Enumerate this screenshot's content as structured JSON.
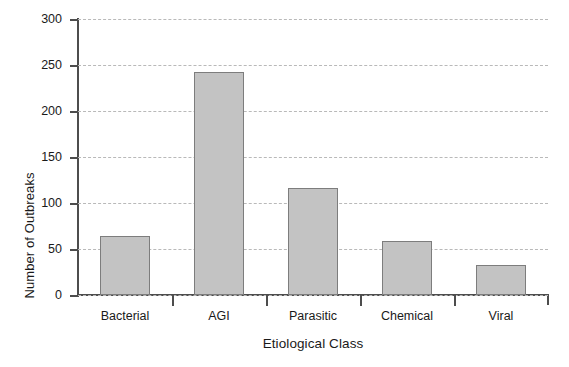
{
  "chart_data": {
    "type": "bar",
    "title": "",
    "xlabel": "Etiological Class",
    "ylabel": "Number of Outbreaks",
    "categories": [
      "Bacterial",
      "AGI",
      "Parasitic",
      "Chemical",
      "Viral"
    ],
    "values": [
      64,
      242,
      116,
      59,
      33
    ],
    "ylim": [
      0,
      300
    ],
    "ytick_values": [
      0,
      50,
      100,
      150,
      200,
      250,
      300
    ],
    "ytick_labels": [
      "0",
      "50",
      "100",
      "150",
      "200",
      "250",
      "300"
    ],
    "grid": "horizontal-dashed",
    "legend": "none",
    "bar_fill_color": "#c3c3c3",
    "bar_edge_color": "#7d7d7d",
    "axis_color": "#4d4d4d",
    "gridline_color": "#b9b9b9",
    "background_color": "#ffffff"
  }
}
